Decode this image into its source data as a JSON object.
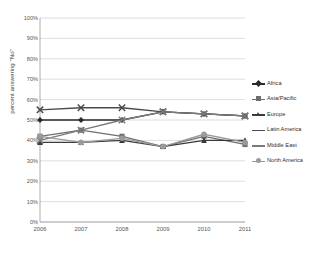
{
  "chart_data": {
    "type": "line",
    "title": "",
    "xlabel": "",
    "ylabel": "percent answering \"No\"",
    "categories": [
      "2006",
      "2007",
      "2008",
      "2009",
      "2010",
      "2011"
    ],
    "x": [
      2006,
      2007,
      2008,
      2009,
      2010,
      2011
    ],
    "ylim": [
      0,
      100
    ],
    "ytick_labels": [
      "0%",
      "10%",
      "20%",
      "30%",
      "40%",
      "50%",
      "60%",
      "70%",
      "80%",
      "90%",
      "100%"
    ],
    "ytick_values": [
      0,
      10,
      20,
      30,
      40,
      50,
      60,
      70,
      80,
      90,
      100
    ],
    "grid": true,
    "legend_position": "right",
    "series": [
      {
        "name": "Africa",
        "color": "#2b2b2b",
        "marker": "diamond",
        "values": [
          50,
          50,
          50,
          54,
          53,
          52
        ]
      },
      {
        "name": "Asia/Pacific",
        "color": "#6e6e6e",
        "marker": "square",
        "values": [
          42,
          45,
          42,
          37,
          42,
          38
        ]
      },
      {
        "name": "Europe",
        "color": "#3a3a3a",
        "marker": "triangle",
        "values": [
          39,
          39,
          40,
          37,
          40,
          40
        ]
      },
      {
        "name": "Latin America",
        "color": "#4a4a4a",
        "marker": "x",
        "values": [
          55,
          56,
          56,
          54,
          53,
          52
        ]
      },
      {
        "name": "Middle East",
        "color": "#7a7a7a",
        "marker": "x",
        "values": [
          40,
          45,
          50,
          54,
          53,
          52
        ]
      },
      {
        "name": "North America",
        "color": "#9a9a9a",
        "marker": "circle",
        "values": [
          42,
          39,
          41,
          37,
          43,
          39
        ]
      }
    ]
  },
  "axis": {
    "x_title": "",
    "y_title": "percent answering \"No\""
  }
}
